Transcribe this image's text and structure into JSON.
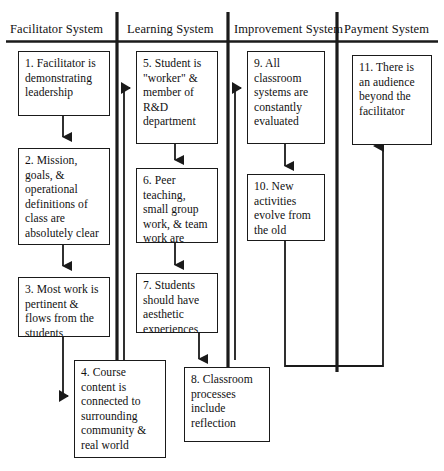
{
  "diagram": {
    "type": "swimlane-flowchart",
    "background_color": "#ffffff",
    "line_color": "#1a1a1a",
    "lanes": [
      {
        "id": "facilitator",
        "title": "Facilitator System"
      },
      {
        "id": "learning",
        "title": "Learning System"
      },
      {
        "id": "improvement",
        "title": "Improvement System"
      },
      {
        "id": "payment",
        "title": "Payment System"
      }
    ],
    "nodes": [
      {
        "id": "n1",
        "number": "1",
        "lane": "facilitator",
        "text": "1. Facilitator is demonstrating leadership"
      },
      {
        "id": "n2",
        "number": "2",
        "lane": "facilitator",
        "text": "2. Mission, goals, & operational definitions of class are absolutely clear"
      },
      {
        "id": "n3",
        "number": "3",
        "lane": "facilitator",
        "text": "3. Most work is pertinent & flows from the students"
      },
      {
        "id": "n4",
        "number": "4",
        "lane": "facilitator",
        "text": "4. Course content is connected to surrounding community & real world"
      },
      {
        "id": "n5",
        "number": "5",
        "lane": "learning",
        "text": "5. Student is \"worker\" & member of R&D department"
      },
      {
        "id": "n6",
        "number": "6",
        "lane": "learning",
        "text": "6. Peer teaching, small group work, & team work are emphasized"
      },
      {
        "id": "n7",
        "number": "7",
        "lane": "learning",
        "text": "7. Students should have aesthetic experiences"
      },
      {
        "id": "n8",
        "number": "8",
        "lane": "learning",
        "text": "8. Classroom processes include reflection"
      },
      {
        "id": "n9",
        "number": "9",
        "lane": "improvement",
        "text": "9. All classroom systems are constantly evaluated"
      },
      {
        "id": "n10",
        "number": "10",
        "lane": "improvement",
        "text": "10. New activities evolve from the old"
      },
      {
        "id": "n11",
        "number": "11",
        "lane": "payment",
        "text": "11. There is an audience beyond the facilitator"
      }
    ],
    "edges": [
      {
        "from": "n1",
        "to": "n2",
        "style": "straight-down"
      },
      {
        "from": "n2",
        "to": "n3",
        "style": "straight-down"
      },
      {
        "from": "n3",
        "to": "n4",
        "style": "down-then-right"
      },
      {
        "from": "n4",
        "to": "n5",
        "style": "up-then-right"
      },
      {
        "from": "n5",
        "to": "n6",
        "style": "straight-down"
      },
      {
        "from": "n6",
        "to": "n7",
        "style": "straight-down"
      },
      {
        "from": "n7",
        "to": "n8",
        "style": "straight-down"
      },
      {
        "from": "n8",
        "to": "n9",
        "style": "up-then-right"
      },
      {
        "from": "n9",
        "to": "n10",
        "style": "straight-down"
      },
      {
        "from": "n10",
        "to": "n11",
        "style": "down-right-up"
      }
    ]
  }
}
